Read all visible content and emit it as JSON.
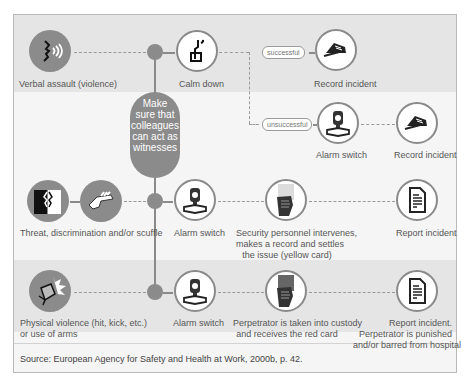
{
  "rows": [
    {
      "name": "verbal",
      "start": {
        "icon": "speaking-face-icon",
        "label": "Verbal assault (violence)"
      },
      "step1": {
        "icon": "calm-person-icon",
        "label": "Calm down"
      },
      "branch_success": {
        "pill": "successful",
        "icon": "writing-hand-icon",
        "label": "Record incident"
      },
      "branch_fail": {
        "pill": "unsuccessful",
        "icon": "alarm-switch-icon",
        "label": "Alarm switch",
        "next": {
          "icon": "writing-hand-icon",
          "label": "Record incident"
        }
      }
    },
    {
      "name": "threat",
      "start": {
        "icons": [
          "arguing-faces-icon",
          "grabbing-hand-icon"
        ],
        "label": "Threat, discrimination and/or scuffle"
      },
      "step1": {
        "icon": "alarm-switch-icon",
        "label": "Alarm switch"
      },
      "step2": {
        "icon": "yellow-card-hand-icon",
        "label_lines": [
          "Security personnel intervenes,",
          "makes a record and settles",
          "the issue (yellow card)"
        ]
      },
      "step3": {
        "icon": "report-document-icon",
        "label": "Report incident"
      }
    },
    {
      "name": "physical",
      "start": {
        "icon": "fist-impact-icon",
        "label_lines": [
          "Physical violence (hit, kick, etc.)",
          "or use of arms"
        ]
      },
      "step1": {
        "icon": "alarm-switch-icon",
        "label": "Alarm switch"
      },
      "step2": {
        "icon": "red-card-hand-icon",
        "label_lines": [
          "Perpetrator is taken into custody",
          "and receives the red card"
        ]
      },
      "step3": {
        "icon": "report-document-icon",
        "label_lines": [
          "Report incident.",
          "Perpetrator is punished",
          "and/or barred from hospital"
        ]
      }
    }
  ],
  "center_note": {
    "lines": [
      "Make",
      "sure that",
      "colleagues",
      "can act as",
      "witnesses"
    ]
  },
  "source": "Source: European Agency for Safety and Health at Work, 2000b, p. 42.",
  "colors": {
    "band_gray": "#e5e5e5",
    "band_light": "#f5f5f5",
    "node": "#8b8b8b",
    "border": "#8a8a8a"
  }
}
